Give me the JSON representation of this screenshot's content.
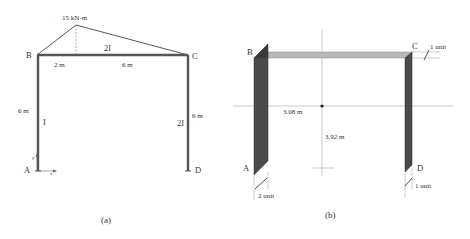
{
  "panel_a": {
    "caption": "(a)",
    "moment_label": "15 kN-m",
    "nodes": {
      "A": "A",
      "B": "B",
      "C": "C",
      "D": "D"
    },
    "beam_stiffness": "2I",
    "left_column_stiffness": "I",
    "right_column_stiffness": "2I",
    "beam_segment_left": "2 m",
    "beam_segment_right": "6 m",
    "left_column_height": "6 m",
    "right_column_height": "6 m",
    "axis_x": "x",
    "axis_y": "y"
  },
  "panel_b": {
    "caption": "(b)",
    "nodes": {
      "A": "A",
      "B": "B",
      "C": "C",
      "D": "D"
    },
    "centroid_x": "3.08 m",
    "centroid_y": "3.92 m",
    "beam_width": "1 unit",
    "left_column_width": "2 unit",
    "right_column_width": "1 unit"
  },
  "colors": {
    "member_line": "#555555",
    "column_fill": "#4a4a4a",
    "beam_fill": "#b8b8b8",
    "axis_line": "#999999",
    "text": "#333333"
  }
}
